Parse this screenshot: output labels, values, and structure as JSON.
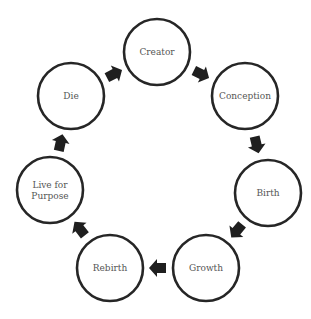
{
  "diagram": {
    "type": "cycle",
    "direction": "clockwise",
    "nodes": [
      {
        "id": "creator",
        "label": [
          "Creator"
        ]
      },
      {
        "id": "conception",
        "label": [
          "Conception"
        ]
      },
      {
        "id": "birth",
        "label": [
          "Birth"
        ]
      },
      {
        "id": "growth",
        "label": [
          "Growth"
        ]
      },
      {
        "id": "rebirth",
        "label": [
          "Rebirth"
        ]
      },
      {
        "id": "live-for-purpose",
        "label": [
          "Live for",
          "Purpose"
        ]
      },
      {
        "id": "die",
        "label": [
          "Die"
        ]
      }
    ],
    "edges": [
      {
        "from": "die",
        "to": "creator"
      },
      {
        "from": "creator",
        "to": "conception"
      },
      {
        "from": "conception",
        "to": "birth"
      },
      {
        "from": "birth",
        "to": "growth"
      },
      {
        "from": "growth",
        "to": "rebirth"
      },
      {
        "from": "rebirth",
        "to": "live-for-purpose"
      },
      {
        "from": "live-for-purpose",
        "to": "die"
      }
    ],
    "colors": {
      "node_stroke": "#262626",
      "node_fill": "#ffffff",
      "arrow": "#1f1f1f",
      "text": "#555555"
    }
  }
}
